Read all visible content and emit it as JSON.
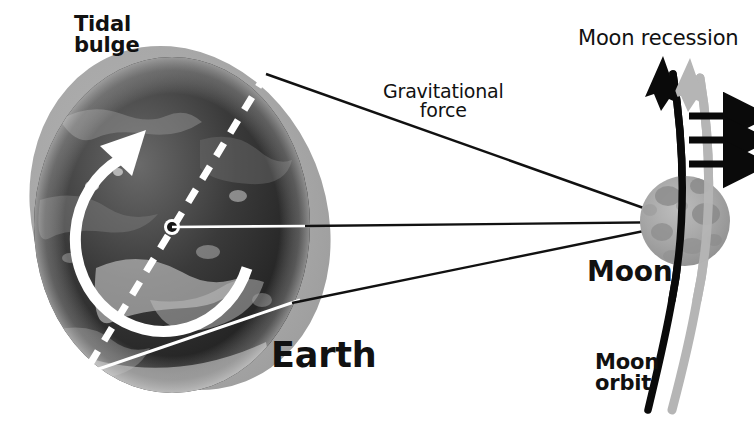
{
  "diagram": {
    "background_color": "#ffffff",
    "labels": {
      "tidal_bulge_line1": "Tidal",
      "tidal_bulge_line2": "bulge",
      "gravitational_force_line1": "Gravitational",
      "gravitational_force_line2": "force",
      "moon_recession": "Moon recession",
      "earth": "Earth",
      "moon": "Moon",
      "moon_orbit_line1": "Moon",
      "moon_orbit_line2": "orbit"
    },
    "colors": {
      "text": "#111111",
      "tidal_bulge_gray": "#a8a8a8",
      "earth_dark": "#2b2b2b",
      "earth_mid": "#6d6d6d",
      "earth_light": "#c9c9c9",
      "moon_gray": "#a0a0a0",
      "moon_crater": "#878787",
      "arrow_black": "#0a0a0a",
      "arrow_gray": "#b0b0b0",
      "axis_white": "#ffffff",
      "orbit_black": "#0a0a0a",
      "orbit_gray": "#b5b5b5"
    },
    "bodies": {
      "earth": {
        "center_x": 172,
        "center_y": 225,
        "radius_x": 138,
        "radius_y": 168,
        "label": "Earth"
      },
      "tidal_bulge": {
        "center_x": 180,
        "center_y": 218,
        "radius_x": 146,
        "radius_y": 176,
        "rotation_deg": -22,
        "label": "Tidal bulge"
      },
      "moon": {
        "center_x": 685,
        "center_y": 221,
        "radius": 45,
        "label": "Moon"
      }
    },
    "earth_features": {
      "rotation_arrow_label": "earth rotation direction",
      "rotation_direction": "counterclockwise",
      "axis_label": "tidal bulge axis",
      "axis_style": "white dashed",
      "center_dot_label": "earth center"
    },
    "gravitational_force_lines": {
      "count": 3,
      "label": "Gravitational force",
      "description": "three straight lines from Earth converging on the Moon"
    },
    "recession_arrows": {
      "black_arrow_label": "moon recession vector",
      "gray_arrow_label": "shifted orbit vector",
      "small_arrows_count": 3,
      "small_arrows_label": "tidal acceleration arrows",
      "small_arrows_direction": "right"
    },
    "moon_orbit": {
      "label": "Moon orbit",
      "black_curve_label": "current moon orbit",
      "gray_curve_label": "receded moon orbit"
    }
  }
}
